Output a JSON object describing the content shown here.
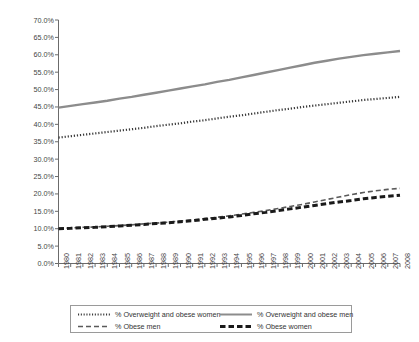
{
  "chart_data": {
    "type": "line",
    "title": "",
    "subtitle": "",
    "xlabel": "",
    "ylabel": "",
    "xlim": [
      1980,
      2008
    ],
    "ylim": [
      0,
      70
    ],
    "y_tick_format": "percent",
    "grid": false,
    "legend_position": "bottom",
    "x": [
      1980,
      1981,
      1982,
      1983,
      1984,
      1985,
      1986,
      1987,
      1988,
      1989,
      1990,
      1991,
      1992,
      1993,
      1994,
      1995,
      1996,
      1997,
      1998,
      1999,
      2000,
      2001,
      2002,
      2003,
      2004,
      2005,
      2006,
      2007,
      2008
    ],
    "categories": [
      "1980",
      "1981",
      "1982",
      "1983",
      "1984",
      "1985",
      "1986",
      "1987",
      "1988",
      "1989",
      "1990",
      "1991",
      "1992",
      "1993",
      "1994",
      "1995",
      "1996",
      "1997",
      "1998",
      "1999",
      "2000",
      "2001",
      "2002",
      "2003",
      "2004",
      "2005",
      "2006",
      "2007",
      "2008"
    ],
    "ylabels": [
      "0.0%",
      "5.0%",
      "10.0%",
      "15.0%",
      "20.0%",
      "25.0%",
      "30.0%",
      "35.0%",
      "40.0%",
      "45.0%",
      "50.0%",
      "55.0%",
      "60.0%",
      "65.0%",
      "70.0%"
    ],
    "yticks": [
      0,
      5,
      10,
      15,
      20,
      25,
      30,
      35,
      40,
      45,
      50,
      55,
      60,
      65,
      70
    ],
    "series": [
      {
        "name": "% Overweight and obese women",
        "style": "dotted",
        "color": "#3a3a3a",
        "width": 2.2,
        "values": [
          36.2,
          36.6,
          37.0,
          37.4,
          37.8,
          38.2,
          38.6,
          39.0,
          39.5,
          39.9,
          40.3,
          40.8,
          41.2,
          41.7,
          42.2,
          42.6,
          43.1,
          43.6,
          44.1,
          44.5,
          45.0,
          45.4,
          45.8,
          46.2,
          46.6,
          47.0,
          47.3,
          47.6,
          47.9
        ]
      },
      {
        "name": "% Overweight and obese men",
        "style": "solid",
        "color": "#8c8c8c",
        "width": 2.4,
        "values": [
          44.8,
          45.3,
          45.8,
          46.3,
          46.8,
          47.4,
          47.9,
          48.5,
          49.1,
          49.7,
          50.3,
          50.9,
          51.5,
          52.2,
          52.8,
          53.5,
          54.2,
          54.9,
          55.6,
          56.3,
          57.0,
          57.7,
          58.3,
          58.9,
          59.4,
          59.9,
          60.3,
          60.7,
          61.1
        ]
      },
      {
        "name": "% Obese men",
        "style": "dashed-thin",
        "color": "#5a5a5a",
        "width": 1.6,
        "values": [
          10.1,
          10.2,
          10.4,
          10.5,
          10.7,
          10.9,
          11.1,
          11.4,
          11.6,
          11.9,
          12.2,
          12.5,
          12.9,
          13.3,
          13.7,
          14.2,
          14.7,
          15.2,
          15.8,
          16.4,
          17.0,
          17.7,
          18.4,
          19.1,
          19.8,
          20.4,
          20.9,
          21.3,
          21.6
        ]
      },
      {
        "name": "% Obese women",
        "style": "dashed-thick",
        "color": "#1a1a1a",
        "width": 3.0,
        "values": [
          10.0,
          10.1,
          10.3,
          10.4,
          10.6,
          10.8,
          11.0,
          11.2,
          11.5,
          11.7,
          12.0,
          12.3,
          12.7,
          13.0,
          13.4,
          13.8,
          14.3,
          14.7,
          15.2,
          15.7,
          16.2,
          16.7,
          17.2,
          17.7,
          18.1,
          18.6,
          19.0,
          19.3,
          19.6
        ]
      }
    ],
    "legend": [
      {
        "label": "% Overweight and obese women",
        "style": "dotted",
        "color": "#3a3a3a"
      },
      {
        "label": "% Overweight and obese men",
        "style": "solid",
        "color": "#8c8c8c"
      },
      {
        "label": "% Obese men",
        "style": "dashed-thin",
        "color": "#5a5a5a"
      },
      {
        "label": "% Obese women",
        "style": "dashed-thick",
        "color": "#1a1a1a"
      }
    ],
    "axis_color": "#6b6b6b",
    "background": "#ffffff"
  }
}
